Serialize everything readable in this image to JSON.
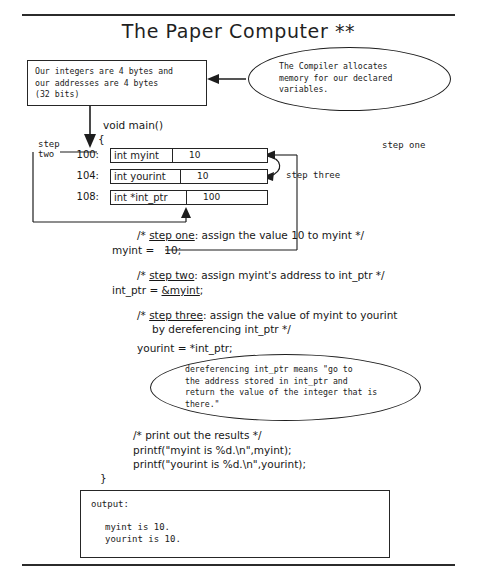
{
  "page": {
    "title": "The Paper Computer **"
  },
  "note_box": {
    "lines": [
      "Our integers are 4 bytes and",
      "our addresses are 4 bytes",
      "(32 bits)"
    ]
  },
  "callouts": {
    "compiler": {
      "lines": [
        "The Compiler allocates",
        "memory for our declared",
        "variables."
      ]
    },
    "dereference": {
      "lines": [
        "dereferencing int_ptr means \"go to",
        "the address stored in int_ptr and",
        "return the value of the integer that is",
        "there.\""
      ]
    }
  },
  "program": {
    "signature": "void main()",
    "open_brace": "{",
    "close_brace": "}",
    "step_one_comment": "/* step one: assign the value 10 to myint */",
    "step_one_comment_pre": "/* ",
    "step_one_comment_label": "step one",
    "step_one_comment_post": ": assign the value 10 to myint */",
    "step_one_stmt": "myint =   10;",
    "step_two_comment_pre": "/* ",
    "step_two_comment_label": "step two",
    "step_two_comment_post": ": assign myint's address to int_ptr */",
    "step_two_stmt_pre": "int_ptr = ",
    "step_two_stmt_amp": "&myint",
    "step_two_stmt_post": ";",
    "step_three_comment_pre": "/* ",
    "step_three_comment_label": "step three",
    "step_three_comment_post": ": assign the value of myint to yourint",
    "step_three_comment_line2": "by dereferencing int_ptr */",
    "step_three_stmt": "yourint = *int_ptr;",
    "print_comment": "/* print out the results */",
    "print_line_1": "printf(\"myint is %d.\\n\",myint);",
    "print_line_2": "printf(\"yourint is %d.\\n\",yourint);"
  },
  "memory": {
    "rows": [
      {
        "address": "100:",
        "declaration": "int myint",
        "value": "10"
      },
      {
        "address": "104:",
        "declaration": "int yourint",
        "value": "10"
      },
      {
        "address": "108:",
        "declaration": "int *int_ptr",
        "value": "100"
      }
    ]
  },
  "labels": {
    "step_two_line1": "step",
    "step_two_line2": "two",
    "step_one": "step one",
    "step_three": "step three"
  },
  "output": {
    "heading": "output:",
    "lines": [
      "myint is 10.",
      "yourint is 10."
    ]
  },
  "colors": {
    "ink": "#1a1a1a",
    "rule": "#2b2b2b",
    "paper": "#ffffff"
  }
}
